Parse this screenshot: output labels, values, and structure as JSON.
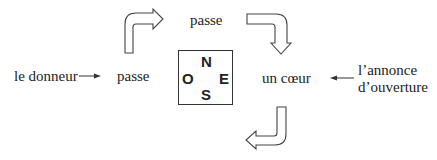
{
  "diagram": {
    "labels": {
      "dealer": "le donneur",
      "west_call": "passe",
      "north_call": "passe",
      "east_call": "un cœur",
      "opening_bid_line1": "l’annonce",
      "opening_bid_line2": "d’ouverture"
    },
    "compass": {
      "north": "N",
      "west": "O",
      "east": "E",
      "south": "S"
    },
    "arrows": [
      {
        "from": "le donneur",
        "to": "passe (O)",
        "style": "thin"
      },
      {
        "from": "l’annonce d’ouverture",
        "to": "un cœur",
        "style": "thin"
      },
      {
        "from": "passe (O)",
        "to": "passe (N)",
        "style": "block-curved"
      },
      {
        "from": "passe (N)",
        "to": "un cœur (E)",
        "style": "block-curved"
      },
      {
        "from": "un cœur (E)",
        "to": "S",
        "style": "block-curved"
      }
    ]
  }
}
